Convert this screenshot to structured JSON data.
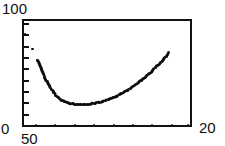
{
  "figure": {
    "background": "#ffffff",
    "ink_color": "#0d0d0d",
    "frame_color": "#111111"
  },
  "axes": {
    "y_top_label": "100",
    "y_bottom_label": "0",
    "x_left_label": "50",
    "x_right_label": "20",
    "y_tick_count": 10,
    "frame": {
      "left": 22,
      "top": 19,
      "width": 170,
      "height": 108
    }
  },
  "chart_data": {
    "type": "scatter",
    "title": "",
    "xlabel": "",
    "ylabel": "",
    "xlim": [
      50,
      20
    ],
    "ylim": [
      0,
      100
    ],
    "grid": false,
    "legend": null,
    "note": "Asymmetric valley curve: steep fall from upper-left, flat minimum, near-linear rise to upper-right. Rendered as dense dot markers. A second sparse series of near-zero points lies along the bottom axis.",
    "series": [
      {
        "name": "curve",
        "marker": "dot",
        "x": [
          50.0,
          48.6,
          47.7,
          47.1,
          46.5,
          46.0,
          45.6,
          45.2,
          44.8,
          44.4,
          44.0,
          43.6,
          43.2,
          42.8,
          42.4,
          42.0,
          41.5,
          41.0,
          40.5,
          40.0,
          39.5,
          39.0,
          38.5,
          38.0,
          37.5,
          37.0,
          36.5,
          36.0,
          35.5,
          35.0,
          34.5,
          34.0,
          33.5,
          33.0,
          32.5,
          32.0,
          31.5,
          31.0,
          30.5,
          30.0,
          29.5,
          29.0,
          28.5,
          28.0,
          27.5,
          27.0,
          26.5,
          26.0,
          25.5,
          25.0,
          24.5,
          24.0
        ],
        "y": [
          88.0,
          74.0,
          63.0,
          55.0,
          48.0,
          42.5,
          38.5,
          35.0,
          32.0,
          29.5,
          27.5,
          25.8,
          24.4,
          23.3,
          22.4,
          21.8,
          21.2,
          20.9,
          20.8,
          20.8,
          20.8,
          20.9,
          21.1,
          21.4,
          21.8,
          22.3,
          22.9,
          23.6,
          24.4,
          25.3,
          26.3,
          27.4,
          28.6,
          29.9,
          31.3,
          32.8,
          34.4,
          36.1,
          37.9,
          39.8,
          41.8,
          43.9,
          46.1,
          48.4,
          50.8,
          53.3,
          55.9,
          58.6,
          61.4,
          64.3,
          67.3,
          70.4
        ]
      },
      {
        "name": "baseline",
        "marker": "dot",
        "x": [
          48.0,
          44.5,
          41.0,
          37.5,
          34.0,
          30.5,
          27.0,
          23.5,
          20.5
        ],
        "y": [
          1.2,
          1.2,
          1.2,
          1.2,
          1.2,
          1.2,
          1.2,
          1.2,
          1.2
        ]
      }
    ]
  }
}
